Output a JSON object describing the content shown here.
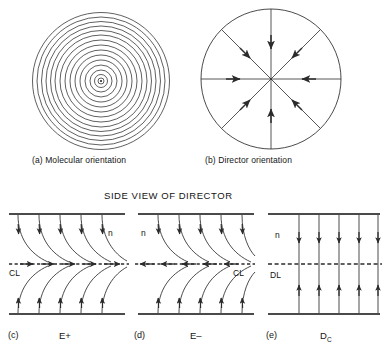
{
  "figure": {
    "background_color": "#ffffff",
    "ink_color": "#262626",
    "section_title": "SIDE VIEW OF DIRECTOR",
    "top_row": {
      "panels": [
        {
          "tag": "(a)",
          "caption": "(a) Molecular orientation",
          "kind": "concentric-circles",
          "ring_count": 15,
          "center_dot": true,
          "outer_radius": 68,
          "center": {
            "x": 101,
            "y": 81
          }
        },
        {
          "tag": "(b)",
          "caption": "(b) Director orientation",
          "kind": "radial-spokes",
          "spoke_count": 8,
          "spoke_angles_deg": [
            0,
            45,
            90,
            135,
            180,
            225,
            270,
            315
          ],
          "arrow_direction": "inward",
          "outer_radius": 70,
          "center": {
            "x": 271,
            "y": 79
          }
        }
      ]
    },
    "bottom_row": {
      "panels": [
        {
          "tag": "(c)",
          "label": "E+",
          "label_sub": "",
          "kind": "splay-bend-right",
          "line_label": "CL",
          "line_label_side": "left",
          "line_style": "dashed",
          "axis_label": "n",
          "axis_label_side": "right",
          "curve_count": 5,
          "center_arrow_direction": "right",
          "center_arrow_count": 5,
          "top_arrow_direction": "down",
          "bottom_arrow_direction": "up"
        },
        {
          "tag": "(d)",
          "label": "E–",
          "label_sub": "",
          "kind": "splay-bend-left",
          "line_label": "CL",
          "line_label_side": "right",
          "line_style": "dashed",
          "axis_label": "n",
          "axis_label_side": "left",
          "curve_count": 5,
          "center_arrow_direction": "left",
          "center_arrow_count": 5,
          "top_arrow_direction": "down",
          "bottom_arrow_direction": "up"
        },
        {
          "tag": "(e)",
          "label": "D",
          "label_sub": "C",
          "kind": "straight-vertical",
          "line_label": "DL",
          "line_label_side": "left",
          "line_style": "dashed",
          "axis_label": "n",
          "axis_label_side": "left",
          "curve_count": 5,
          "center_arrow_direction": "none",
          "top_arrow_direction": "down",
          "bottom_arrow_direction": "up"
        }
      ]
    }
  }
}
